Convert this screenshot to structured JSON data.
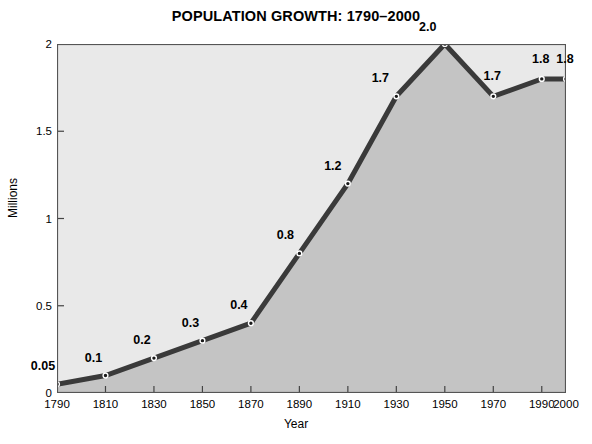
{
  "chart_data": {
    "type": "area",
    "title": "POPULATION GROWTH: 1790–2000",
    "xlabel": "Year",
    "ylabel": "Millions",
    "categories": [
      1790,
      1810,
      1830,
      1850,
      1870,
      1890,
      1910,
      1930,
      1950,
      1970,
      1990,
      2000
    ],
    "values": [
      0.05,
      0.1,
      0.2,
      0.3,
      0.4,
      0.8,
      1.2,
      1.7,
      2.0,
      1.7,
      1.8,
      1.8
    ],
    "point_labels": [
      "0.05",
      "0.1",
      "0.2",
      "0.3",
      "0.4",
      "0.8",
      "1.2",
      "1.7",
      "2.0",
      "1.7",
      "1.8",
      "1.8"
    ],
    "xtick_labels": [
      "1790",
      "1810",
      "1830",
      "1850",
      "1870",
      "1890",
      "1910",
      "1930",
      "1950",
      "1970",
      "1990",
      "2000"
    ],
    "ytick_values": [
      0,
      0.5,
      1,
      1.5,
      2
    ],
    "ytick_labels": [
      "0",
      "0.5",
      "1",
      "1.5",
      "2"
    ],
    "xlim": [
      1790,
      2000
    ],
    "ylim": [
      0,
      2
    ],
    "grid": false,
    "legend": false,
    "colors": {
      "line": "#3a3a3a",
      "fill": "#c4c4c4",
      "plot_background": "#e9e9e9",
      "plot_border": "#555555",
      "marker": "#1a1a1a",
      "marker_edge": "#ffffff",
      "text": "#000000",
      "page_background": "#ffffff"
    }
  }
}
